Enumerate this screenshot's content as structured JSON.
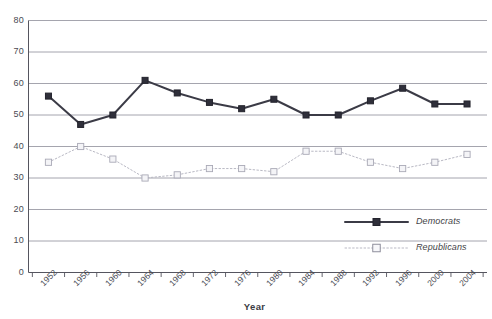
{
  "chart_data": {
    "type": "line",
    "title": "",
    "xlabel": "Year",
    "ylabel": "",
    "ylim": [
      0,
      80
    ],
    "ytick_step": 10,
    "grid": true,
    "legend_position": "inside-bottom-right",
    "categories": [
      "1952",
      "1956",
      "1960",
      "1964",
      "1968",
      "1972",
      "1976",
      "1980",
      "1984",
      "1988",
      "1992",
      "1996",
      "2000",
      "2004"
    ],
    "yticks": [
      "0",
      "10",
      "20",
      "30",
      "40",
      "50",
      "60",
      "70",
      "80"
    ],
    "series": [
      {
        "name": "Democrats",
        "color": "#3b3b46",
        "style": "solid",
        "marker": "filled-square",
        "values": [
          56,
          47,
          50,
          61,
          57,
          54,
          52,
          55,
          50,
          50,
          54.5,
          58.5,
          53.5,
          53.5
        ]
      },
      {
        "name": "Republicans",
        "color": "#b9b9c4",
        "style": "dotted",
        "marker": "open-square",
        "values": [
          35,
          40,
          36,
          30,
          31,
          33,
          33,
          32,
          38.5,
          38.5,
          35,
          33,
          35,
          37.5
        ]
      }
    ]
  },
  "axis": {
    "x_title": "Year"
  },
  "legend": {
    "items": [
      {
        "label": "Democrats"
      },
      {
        "label": "Republicans"
      }
    ]
  }
}
